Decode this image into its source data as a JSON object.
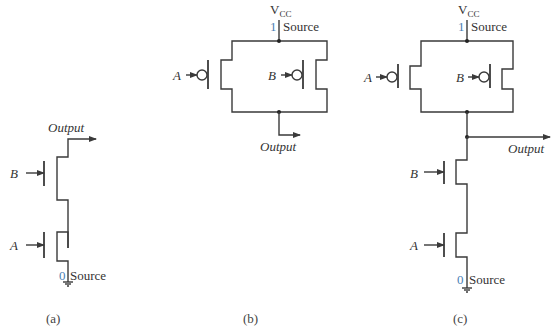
{
  "figure": {
    "panels": [
      {
        "id": "a",
        "caption": "(a)",
        "output_label": "Output",
        "inputs": [
          "B",
          "A"
        ],
        "source_value": "0",
        "source_label": "Source"
      },
      {
        "id": "b",
        "caption": "(b)",
        "supply_label": "V",
        "supply_sub": "CC",
        "source_value": "1",
        "source_label": "Source",
        "inputs": [
          "A",
          "B"
        ],
        "output_label": "Output"
      },
      {
        "id": "c",
        "caption": "(c)",
        "supply_label": "V",
        "supply_sub": "CC",
        "source_value": "1",
        "source_label": "Source",
        "pmos_inputs": [
          "A",
          "B"
        ],
        "nmos_inputs": [
          "B",
          "A"
        ],
        "output_label": "Output",
        "ground_value": "0",
        "ground_label": "Source"
      }
    ]
  },
  "colors": {
    "wire": "#3a3a3a",
    "logic_value": "#4a7fb5",
    "text": "#333333"
  }
}
